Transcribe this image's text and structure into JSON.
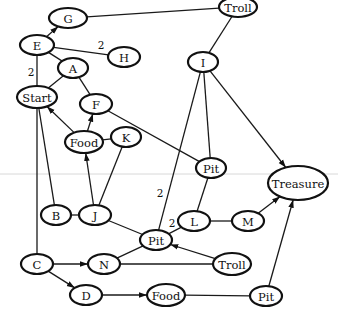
{
  "diagram": {
    "type": "graph",
    "background_line_y": 174,
    "nodes": [
      {
        "id": "G",
        "label": "G",
        "x": 68,
        "y": 18,
        "rx": 19,
        "ry": 10
      },
      {
        "id": "Troll1",
        "label": "Troll",
        "x": 238,
        "y": 7,
        "rx": 19,
        "ry": 10
      },
      {
        "id": "E",
        "label": "E",
        "x": 37,
        "y": 45,
        "rx": 17,
        "ry": 10
      },
      {
        "id": "H",
        "label": "H",
        "x": 124,
        "y": 57,
        "rx": 16,
        "ry": 10
      },
      {
        "id": "I",
        "label": "I",
        "x": 203,
        "y": 62,
        "rx": 15,
        "ry": 10
      },
      {
        "id": "A",
        "label": "A",
        "x": 73,
        "y": 68,
        "rx": 15,
        "ry": 10
      },
      {
        "id": "Start",
        "label": "Start",
        "x": 37,
        "y": 97,
        "rx": 20,
        "ry": 11
      },
      {
        "id": "F",
        "label": "F",
        "x": 96,
        "y": 104,
        "rx": 16,
        "ry": 10
      },
      {
        "id": "Food1",
        "label": "Food",
        "x": 84,
        "y": 142,
        "rx": 19,
        "ry": 11
      },
      {
        "id": "K",
        "label": "K",
        "x": 126,
        "y": 137,
        "rx": 15,
        "ry": 10
      },
      {
        "id": "Pit1",
        "label": "Pit",
        "x": 211,
        "y": 168,
        "rx": 15,
        "ry": 10
      },
      {
        "id": "Treasure",
        "label": "Treasure",
        "x": 298,
        "y": 183,
        "rx": 30,
        "ry": 17
      },
      {
        "id": "B",
        "label": "B",
        "x": 56,
        "y": 215,
        "rx": 15,
        "ry": 10
      },
      {
        "id": "J",
        "label": "J",
        "x": 95,
        "y": 215,
        "rx": 16,
        "ry": 10
      },
      {
        "id": "L",
        "label": "L",
        "x": 194,
        "y": 221,
        "rx": 16,
        "ry": 10
      },
      {
        "id": "M",
        "label": "M",
        "x": 248,
        "y": 221,
        "rx": 16,
        "ry": 10
      },
      {
        "id": "Pit2",
        "label": "Pit",
        "x": 156,
        "y": 240,
        "rx": 16,
        "ry": 10
      },
      {
        "id": "C",
        "label": "C",
        "x": 37,
        "y": 264,
        "rx": 16,
        "ry": 10
      },
      {
        "id": "N",
        "label": "N",
        "x": 104,
        "y": 264,
        "rx": 16,
        "ry": 10
      },
      {
        "id": "Troll2",
        "label": "Troll",
        "x": 232,
        "y": 264,
        "rx": 19,
        "ry": 11
      },
      {
        "id": "D",
        "label": "D",
        "x": 86,
        "y": 295,
        "rx": 16,
        "ry": 10
      },
      {
        "id": "Food2",
        "label": "Food",
        "x": 166,
        "y": 295,
        "rx": 19,
        "ry": 11
      },
      {
        "id": "Pit3",
        "label": "Pit",
        "x": 266,
        "y": 296,
        "rx": 16,
        "ry": 10
      }
    ],
    "edges": [
      {
        "from": "E",
        "to": "G",
        "directed": true,
        "label": ""
      },
      {
        "from": "G",
        "to": "Troll1",
        "directed": false,
        "label": ""
      },
      {
        "from": "E",
        "to": "H",
        "directed": false,
        "label": "2",
        "lx": 101,
        "ly": 45
      },
      {
        "from": "E",
        "to": "A",
        "directed": false,
        "label": ""
      },
      {
        "from": "E",
        "to": "Start",
        "directed": false,
        "label": "2",
        "lx": 31,
        "ly": 72
      },
      {
        "from": "Troll1",
        "to": "I",
        "directed": false,
        "label": ""
      },
      {
        "from": "A",
        "to": "Start",
        "directed": false,
        "label": ""
      },
      {
        "from": "A",
        "to": "F",
        "directed": false,
        "label": ""
      },
      {
        "from": "I",
        "to": "Treasure",
        "directed": true,
        "label": ""
      },
      {
        "from": "I",
        "to": "Pit1",
        "directed": false,
        "label": ""
      },
      {
        "from": "I",
        "to": "Pit2",
        "directed": false,
        "label": "2",
        "lx": 160,
        "ly": 193
      },
      {
        "from": "F",
        "to": "Pit1",
        "directed": false,
        "label": ""
      },
      {
        "from": "Food1",
        "to": "Start",
        "directed": true,
        "label": ""
      },
      {
        "from": "Food1",
        "to": "F",
        "directed": true,
        "label": ""
      },
      {
        "from": "Food1",
        "to": "K",
        "directed": false,
        "label": ""
      },
      {
        "from": "J",
        "to": "Food1",
        "directed": true,
        "label": ""
      },
      {
        "from": "K",
        "to": "J",
        "directed": false,
        "label": ""
      },
      {
        "from": "Start",
        "to": "B",
        "directed": false,
        "label": ""
      },
      {
        "from": "Start",
        "to": "C",
        "directed": false,
        "label": ""
      },
      {
        "from": "B",
        "to": "J",
        "directed": false,
        "label": ""
      },
      {
        "from": "J",
        "to": "Pit2",
        "directed": false,
        "label": ""
      },
      {
        "from": "Pit1",
        "to": "L",
        "directed": false,
        "label": ""
      },
      {
        "from": "L",
        "to": "Pit2",
        "directed": false,
        "label": "2",
        "lx": 172,
        "ly": 223
      },
      {
        "from": "L",
        "to": "M",
        "directed": false,
        "label": ""
      },
      {
        "from": "M",
        "to": "Treasure",
        "directed": true,
        "label": ""
      },
      {
        "from": "Pit2",
        "to": "N",
        "directed": false,
        "label": ""
      },
      {
        "from": "Troll2",
        "to": "Pit2",
        "directed": true,
        "label": ""
      },
      {
        "from": "N",
        "to": "Troll2",
        "directed": false,
        "label": ""
      },
      {
        "from": "C",
        "to": "N",
        "directed": true,
        "label": ""
      },
      {
        "from": "C",
        "to": "D",
        "directed": true,
        "label": ""
      },
      {
        "from": "D",
        "to": "Food2",
        "directed": true,
        "label": ""
      },
      {
        "from": "Food2",
        "to": "Pit3",
        "directed": false,
        "label": ""
      },
      {
        "from": "Pit3",
        "to": "Treasure",
        "directed": true,
        "label": ""
      }
    ]
  }
}
